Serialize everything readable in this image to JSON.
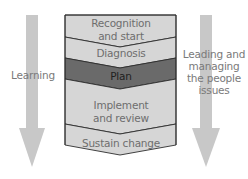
{
  "diagram": {
    "left_arrow": {
      "label": "Learning"
    },
    "right_arrow": {
      "label": "Leading and managing the people issues"
    },
    "stages": [
      {
        "label": "Recognition and start",
        "highlight": false
      },
      {
        "label": "Diagnosis",
        "highlight": false
      },
      {
        "label": "Plan",
        "highlight": true
      },
      {
        "label": "Implement and review",
        "highlight": false
      },
      {
        "label": "Sustain change",
        "highlight": false
      }
    ],
    "colors": {
      "arrow": "#c8c8c8",
      "stage_fill": "#d6d6d6",
      "highlight_fill": "#6a6a6a",
      "outline": "#2e2e2e"
    }
  }
}
